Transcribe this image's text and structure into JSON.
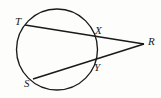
{
  "figure": {
    "kind": "geometry-diagram",
    "background_color": "#fdfdfc",
    "stroke_color": "#1a1a1a",
    "width": 161,
    "height": 98,
    "circle": {
      "name": "circle",
      "cx": 57,
      "cy": 49.5,
      "r": 40.5
    },
    "points": {
      "T": {
        "label": "T",
        "x": 25.0,
        "y": 25.0,
        "label_x": 15,
        "label_y": 16
      },
      "X": {
        "label": "X",
        "x": 93.0,
        "y": 38.0,
        "label_x": 95,
        "label_y": 25
      },
      "R": {
        "label": "R",
        "x": 144.0,
        "y": 44.0,
        "label_x": 148,
        "label_y": 36
      },
      "Y": {
        "label": "Y",
        "x": 92.5,
        "y": 60.5,
        "label_x": 94,
        "label_y": 62
      },
      "S": {
        "label": "S",
        "x": 33.0,
        "y": 79.0,
        "label_x": 24,
        "label_y": 78
      }
    },
    "segments": [
      {
        "name": "secant-T-R",
        "from": "T",
        "to": "R",
        "through": "X"
      },
      {
        "name": "secant-S-R",
        "from": "S",
        "to": "R",
        "through": "Y"
      }
    ]
  }
}
